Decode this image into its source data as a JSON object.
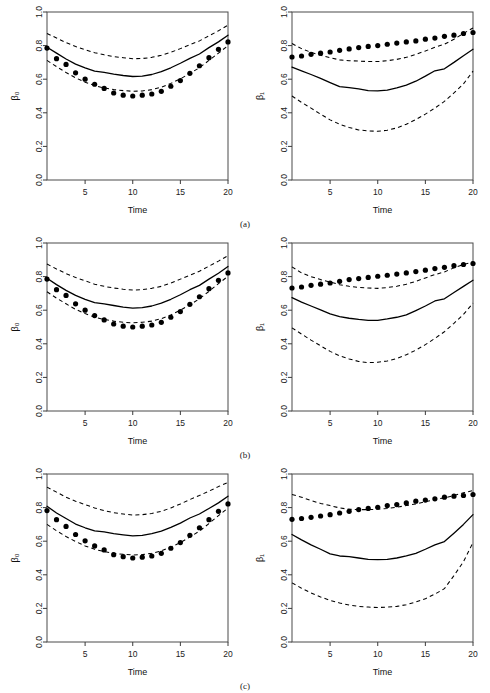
{
  "figure": {
    "panel_rows": [
      {
        "caption": "(a)",
        "key": "a"
      },
      {
        "caption": "(b)",
        "key": "b"
      },
      {
        "caption": "(c)",
        "key": "c"
      }
    ]
  },
  "axes": {
    "xlabel": "Time",
    "ylabel_beta0": "β₀",
    "ylabel_beta1": "β₁",
    "xticks": [
      5,
      10,
      15,
      20
    ],
    "xticklabels": [
      "5",
      "10",
      "15",
      "20"
    ],
    "yticks": [
      0.0,
      0.2,
      0.4,
      0.6,
      0.8,
      1.0
    ],
    "yticklabels": [
      "0.0",
      "0.2",
      "0.4",
      "0.6",
      "0.8",
      "1.0"
    ],
    "xlim": [
      1,
      20
    ],
    "ylim": [
      0.0,
      1.0
    ]
  },
  "style": {
    "mean_color": "#000000",
    "band_color": "#000000",
    "dot_color": "#000000",
    "box_color": "#4a4a4a",
    "background": "#ffffff"
  },
  "chart_data": [
    {
      "type": "line",
      "id": "a-beta0",
      "title": "",
      "xlabel": "Time",
      "ylabel": "β₀",
      "xlim": [
        1,
        20
      ],
      "ylim": [
        0.0,
        1.0
      ],
      "grid": false,
      "legend": "none",
      "x": [
        1,
        2,
        3,
        4,
        5,
        6,
        7,
        8,
        9,
        10,
        11,
        12,
        13,
        14,
        15,
        16,
        17,
        18,
        19,
        20
      ],
      "series": [
        {
          "name": "estimate",
          "style": "solid",
          "values": [
            0.79,
            0.755,
            0.72,
            0.69,
            0.668,
            0.648,
            0.64,
            0.63,
            0.622,
            0.616,
            0.618,
            0.628,
            0.645,
            0.668,
            0.695,
            0.724,
            0.75,
            0.788,
            0.822,
            0.862
          ]
        },
        {
          "name": "upper 95% band",
          "style": "dashed",
          "values": [
            0.872,
            0.845,
            0.818,
            0.795,
            0.775,
            0.758,
            0.745,
            0.735,
            0.728,
            0.722,
            0.723,
            0.73,
            0.742,
            0.76,
            0.782,
            0.805,
            0.828,
            0.858,
            0.888,
            0.922
          ]
        },
        {
          "name": "lower 95% band",
          "style": "dashed",
          "values": [
            0.712,
            0.675,
            0.64,
            0.608,
            0.582,
            0.562,
            0.548,
            0.538,
            0.532,
            0.528,
            0.53,
            0.538,
            0.552,
            0.575,
            0.602,
            0.635,
            0.668,
            0.712,
            0.755,
            0.8
          ]
        },
        {
          "name": "true value",
          "style": "points",
          "values": [
            0.785,
            0.722,
            0.688,
            0.638,
            0.6,
            0.57,
            0.545,
            0.518,
            0.505,
            0.5,
            0.505,
            0.512,
            0.528,
            0.558,
            0.592,
            0.635,
            0.68,
            0.728,
            0.778,
            0.822
          ]
        }
      ]
    },
    {
      "type": "line",
      "id": "a-beta1",
      "title": "",
      "xlabel": "Time",
      "ylabel": "β₁",
      "xlim": [
        1,
        20
      ],
      "ylim": [
        0.0,
        1.0
      ],
      "grid": false,
      "legend": "none",
      "x": [
        1,
        2,
        3,
        4,
        5,
        6,
        7,
        8,
        9,
        10,
        11,
        12,
        13,
        14,
        15,
        16,
        17,
        18,
        19,
        20
      ],
      "series": [
        {
          "name": "estimate",
          "style": "solid",
          "values": [
            0.672,
            0.65,
            0.628,
            0.605,
            0.58,
            0.556,
            0.55,
            0.542,
            0.532,
            0.53,
            0.535,
            0.548,
            0.565,
            0.588,
            0.618,
            0.65,
            0.662,
            0.7,
            0.74,
            0.778
          ]
        },
        {
          "name": "upper 95% band",
          "style": "dashed",
          "values": [
            0.812,
            0.782,
            0.76,
            0.742,
            0.728,
            0.715,
            0.71,
            0.708,
            0.705,
            0.705,
            0.71,
            0.718,
            0.73,
            0.748,
            0.768,
            0.79,
            0.808,
            0.838,
            0.872,
            0.905
          ]
        },
        {
          "name": "lower 95% band",
          "style": "dashed",
          "values": [
            0.5,
            0.462,
            0.428,
            0.392,
            0.358,
            0.332,
            0.312,
            0.298,
            0.292,
            0.29,
            0.296,
            0.31,
            0.332,
            0.36,
            0.392,
            0.428,
            0.468,
            0.518,
            0.572,
            0.648
          ]
        },
        {
          "name": "true value",
          "style": "points",
          "values": [
            0.732,
            0.738,
            0.748,
            0.755,
            0.762,
            0.772,
            0.78,
            0.788,
            0.795,
            0.8,
            0.808,
            0.815,
            0.822,
            0.828,
            0.838,
            0.845,
            0.855,
            0.862,
            0.872,
            0.878
          ]
        }
      ]
    },
    {
      "type": "line",
      "id": "b-beta0",
      "title": "",
      "xlabel": "Time",
      "ylabel": "β₀",
      "xlim": [
        1,
        20
      ],
      "ylim": [
        0.0,
        1.0
      ],
      "grid": false,
      "legend": "none",
      "x": [
        1,
        2,
        3,
        4,
        5,
        6,
        7,
        8,
        9,
        10,
        11,
        12,
        13,
        14,
        15,
        16,
        17,
        18,
        19,
        20
      ],
      "series": [
        {
          "name": "estimate",
          "style": "solid",
          "values": [
            0.79,
            0.752,
            0.718,
            0.688,
            0.665,
            0.645,
            0.638,
            0.628,
            0.618,
            0.612,
            0.615,
            0.625,
            0.642,
            0.665,
            0.692,
            0.722,
            0.748,
            0.785,
            0.82,
            0.86
          ]
        },
        {
          "name": "upper 95% band",
          "style": "dashed",
          "values": [
            0.875,
            0.845,
            0.818,
            0.795,
            0.775,
            0.755,
            0.742,
            0.732,
            0.725,
            0.72,
            0.722,
            0.73,
            0.742,
            0.762,
            0.785,
            0.808,
            0.832,
            0.862,
            0.892,
            0.925
          ]
        },
        {
          "name": "lower 95% band",
          "style": "dashed",
          "values": [
            0.71,
            0.672,
            0.638,
            0.605,
            0.58,
            0.558,
            0.545,
            0.535,
            0.528,
            0.525,
            0.528,
            0.535,
            0.55,
            0.572,
            0.6,
            0.632,
            0.668,
            0.712,
            0.758,
            0.802
          ]
        },
        {
          "name": "true value",
          "style": "points",
          "values": [
            0.785,
            0.722,
            0.688,
            0.638,
            0.6,
            0.568,
            0.542,
            0.518,
            0.505,
            0.5,
            0.505,
            0.512,
            0.528,
            0.558,
            0.592,
            0.635,
            0.68,
            0.728,
            0.778,
            0.822
          ]
        }
      ]
    },
    {
      "type": "line",
      "id": "b-beta1",
      "title": "",
      "xlabel": "Time",
      "ylabel": "β₁",
      "xlim": [
        1,
        20
      ],
      "ylim": [
        0.0,
        1.0
      ],
      "grid": false,
      "legend": "none",
      "x": [
        1,
        2,
        3,
        4,
        5,
        6,
        7,
        8,
        9,
        10,
        11,
        12,
        13,
        14,
        15,
        16,
        17,
        18,
        19,
        20
      ],
      "series": [
        {
          "name": "estimate",
          "style": "solid",
          "values": [
            0.675,
            0.648,
            0.625,
            0.602,
            0.578,
            0.562,
            0.552,
            0.545,
            0.54,
            0.54,
            0.548,
            0.558,
            0.572,
            0.598,
            0.625,
            0.655,
            0.668,
            0.705,
            0.742,
            0.778
          ]
        },
        {
          "name": "upper 95% band",
          "style": "dashed",
          "values": [
            0.858,
            0.822,
            0.8,
            0.782,
            0.768,
            0.752,
            0.742,
            0.735,
            0.732,
            0.73,
            0.735,
            0.742,
            0.755,
            0.772,
            0.792,
            0.812,
            0.828,
            0.852,
            0.872,
            0.888
          ]
        },
        {
          "name": "lower 95% band",
          "style": "dashed",
          "values": [
            0.495,
            0.458,
            0.422,
            0.388,
            0.355,
            0.328,
            0.31,
            0.295,
            0.288,
            0.29,
            0.298,
            0.312,
            0.335,
            0.362,
            0.395,
            0.432,
            0.472,
            0.522,
            0.575,
            0.642
          ]
        },
        {
          "name": "true value",
          "style": "points",
          "values": [
            0.732,
            0.738,
            0.748,
            0.755,
            0.762,
            0.772,
            0.782,
            0.788,
            0.795,
            0.802,
            0.808,
            0.815,
            0.822,
            0.83,
            0.838,
            0.848,
            0.855,
            0.865,
            0.872,
            0.878
          ]
        }
      ]
    },
    {
      "type": "line",
      "id": "c-beta0",
      "title": "",
      "xlabel": "Time",
      "ylabel": "β₀",
      "xlim": [
        1,
        20
      ],
      "ylim": [
        0.0,
        1.0
      ],
      "grid": false,
      "legend": "none",
      "x": [
        1,
        2,
        3,
        4,
        5,
        6,
        7,
        8,
        9,
        10,
        11,
        12,
        13,
        14,
        15,
        16,
        17,
        18,
        19,
        20
      ],
      "series": [
        {
          "name": "estimate",
          "style": "solid",
          "values": [
            0.808,
            0.768,
            0.735,
            0.702,
            0.68,
            0.662,
            0.655,
            0.645,
            0.638,
            0.632,
            0.635,
            0.645,
            0.66,
            0.682,
            0.708,
            0.738,
            0.762,
            0.795,
            0.828,
            0.868
          ]
        },
        {
          "name": "upper 95% band",
          "style": "dashed",
          "values": [
            0.922,
            0.892,
            0.862,
            0.838,
            0.818,
            0.798,
            0.782,
            0.77,
            0.762,
            0.755,
            0.758,
            0.765,
            0.778,
            0.798,
            0.822,
            0.848,
            0.872,
            0.898,
            0.925,
            0.95
          ]
        },
        {
          "name": "lower 95% band",
          "style": "dashed",
          "values": [
            0.7,
            0.662,
            0.628,
            0.598,
            0.572,
            0.552,
            0.538,
            0.528,
            0.522,
            0.518,
            0.52,
            0.528,
            0.542,
            0.565,
            0.592,
            0.625,
            0.66,
            0.705,
            0.752,
            0.798
          ]
        },
        {
          "name": "true value",
          "style": "points",
          "values": [
            0.782,
            0.728,
            0.688,
            0.64,
            0.602,
            0.572,
            0.548,
            0.52,
            0.508,
            0.5,
            0.505,
            0.512,
            0.528,
            0.558,
            0.592,
            0.635,
            0.68,
            0.728,
            0.778,
            0.822
          ]
        }
      ]
    },
    {
      "type": "line",
      "id": "c-beta1",
      "title": "",
      "xlabel": "Time",
      "ylabel": "β₁",
      "xlim": [
        1,
        20
      ],
      "ylim": [
        0.0,
        1.0
      ],
      "grid": false,
      "legend": "none",
      "x": [
        1,
        2,
        3,
        4,
        5,
        6,
        7,
        8,
        9,
        10,
        11,
        12,
        13,
        14,
        15,
        16,
        17,
        18,
        19,
        20
      ],
      "series": [
        {
          "name": "estimate",
          "style": "solid",
          "values": [
            0.64,
            0.608,
            0.578,
            0.552,
            0.525,
            0.512,
            0.508,
            0.5,
            0.492,
            0.49,
            0.492,
            0.5,
            0.512,
            0.528,
            0.552,
            0.578,
            0.598,
            0.648,
            0.7,
            0.758
          ]
        },
        {
          "name": "upper 95% band",
          "style": "dashed",
          "values": [
            0.878,
            0.862,
            0.842,
            0.825,
            0.812,
            0.798,
            0.79,
            0.788,
            0.788,
            0.79,
            0.795,
            0.802,
            0.812,
            0.822,
            0.835,
            0.848,
            0.858,
            0.872,
            0.888,
            0.902
          ]
        },
        {
          "name": "lower 95% band",
          "style": "dashed",
          "values": [
            0.352,
            0.32,
            0.292,
            0.268,
            0.248,
            0.232,
            0.22,
            0.212,
            0.208,
            0.205,
            0.208,
            0.212,
            0.222,
            0.238,
            0.258,
            0.285,
            0.318,
            0.395,
            0.478,
            0.592
          ]
        },
        {
          "name": "true value",
          "style": "points",
          "values": [
            0.73,
            0.735,
            0.742,
            0.75,
            0.758,
            0.768,
            0.778,
            0.788,
            0.795,
            0.802,
            0.812,
            0.818,
            0.828,
            0.838,
            0.845,
            0.852,
            0.862,
            0.868,
            0.872,
            0.878
          ]
        }
      ]
    }
  ]
}
